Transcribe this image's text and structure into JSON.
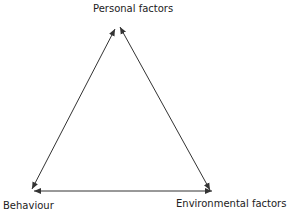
{
  "diagram": {
    "nodes": {
      "top": "Personal factors",
      "left": "Behaviour",
      "right": "Environmental factors"
    },
    "edges": [
      {
        "from": "Personal factors",
        "to": "Behaviour",
        "direction": "bidirectional"
      },
      {
        "from": "Personal factors",
        "to": "Environmental factors",
        "direction": "bidirectional"
      },
      {
        "from": "Behaviour",
        "to": "Environmental factors",
        "direction": "bidirectional"
      }
    ],
    "colors": {
      "line": "#333333",
      "text": "#222222"
    }
  }
}
